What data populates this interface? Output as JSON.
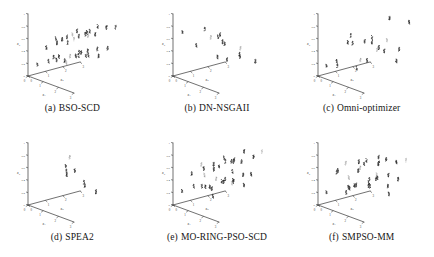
{
  "figure": {
    "title": "",
    "background": "#ffffff",
    "ink_color": "#222222",
    "panel_order": [
      "a",
      "b",
      "c",
      "d",
      "e",
      "f"
    ]
  },
  "chart_data": [
    {
      "type": "scatter",
      "id": "a",
      "panel_label": "(a)",
      "title": "BSO-SCD",
      "projection": "3d",
      "xlabel": "x1",
      "ylabel": "x2",
      "zlabel": "x3",
      "xlim": [
        0,
        3
      ],
      "ylim": [
        0,
        3
      ],
      "zlim": [
        0,
        1
      ],
      "xticks": [
        0,
        1,
        2,
        3
      ],
      "yticks": [
        0,
        1,
        2,
        3
      ],
      "zticks": [
        0,
        0.2,
        0.4,
        0.6,
        0.8,
        1
      ],
      "grid": false,
      "legend": "none",
      "marker": "dot",
      "marker_color": "#262626",
      "n_clusters": 36,
      "description": "Dense, evenly spread 6x6 lattice of tight solution clusters filling the decision space",
      "points": [
        [
          0.28,
          0.3,
          0.18
        ],
        [
          0.3,
          0.92,
          0.2
        ],
        [
          0.26,
          1.55,
          0.22
        ],
        [
          0.31,
          2.15,
          0.19
        ],
        [
          0.27,
          2.7,
          0.21
        ],
        [
          0.29,
          1.22,
          0.24
        ],
        [
          0.88,
          0.28,
          0.52
        ],
        [
          0.9,
          0.88,
          0.55
        ],
        [
          0.86,
          1.52,
          0.5
        ],
        [
          0.92,
          2.12,
          0.57
        ],
        [
          0.89,
          2.68,
          0.53
        ],
        [
          0.87,
          1.2,
          0.58
        ],
        [
          1.48,
          0.3,
          0.72
        ],
        [
          1.52,
          0.9,
          0.7
        ],
        [
          1.5,
          1.5,
          0.75
        ],
        [
          1.46,
          2.1,
          0.68
        ],
        [
          1.54,
          2.66,
          0.74
        ],
        [
          1.49,
          1.24,
          0.71
        ],
        [
          2.08,
          0.28,
          0.42
        ],
        [
          2.12,
          0.88,
          0.45
        ],
        [
          2.06,
          1.52,
          0.4
        ],
        [
          2.1,
          2.14,
          0.47
        ],
        [
          2.14,
          2.7,
          0.44
        ],
        [
          2.09,
          1.22,
          0.48
        ],
        [
          2.66,
          0.3,
          0.82
        ],
        [
          2.7,
          0.92,
          0.85
        ],
        [
          2.64,
          1.54,
          0.8
        ],
        [
          2.72,
          2.12,
          0.87
        ],
        [
          2.68,
          2.68,
          0.83
        ],
        [
          2.67,
          1.2,
          0.88
        ],
        [
          1.18,
          0.6,
          0.32
        ],
        [
          1.8,
          0.62,
          0.34
        ],
        [
          1.2,
          1.85,
          0.3
        ],
        [
          1.82,
          1.88,
          0.36
        ],
        [
          1.16,
          2.42,
          0.33
        ],
        [
          1.84,
          2.44,
          0.31
        ]
      ]
    },
    {
      "type": "scatter",
      "id": "b",
      "panel_label": "(b)",
      "title": "DN-NSGAII",
      "projection": "3d",
      "xlabel": "x1",
      "ylabel": "x2",
      "zlabel": "x3",
      "xlim": [
        0,
        3
      ],
      "ylim": [
        0,
        3
      ],
      "zlim": [
        0,
        1
      ],
      "xticks": [
        0,
        1,
        2,
        3
      ],
      "yticks": [
        0,
        1,
        2,
        3
      ],
      "zticks": [
        0,
        0.2,
        0.4,
        0.6,
        0.8,
        1
      ],
      "grid": false,
      "legend": "none",
      "marker": "dot",
      "marker_color": "#262626",
      "n_clusters": 14,
      "description": "Sparse scatter, only a handful of isolated elongated clusters, poor coverage",
      "points": [
        [
          0.26,
          0.32,
          0.7
        ],
        [
          0.28,
          1.1,
          0.44
        ],
        [
          0.3,
          2.3,
          0.16
        ],
        [
          0.88,
          1.4,
          0.6
        ],
        [
          1.5,
          0.5,
          0.86
        ],
        [
          1.56,
          1.6,
          0.54
        ],
        [
          1.48,
          2.55,
          0.26
        ],
        [
          2.05,
          1.05,
          0.66
        ],
        [
          2.12,
          1.95,
          0.4
        ],
        [
          2.62,
          0.4,
          0.88
        ],
        [
          2.7,
          1.5,
          0.58
        ],
        [
          2.66,
          2.4,
          0.3
        ],
        [
          1.9,
          0.92,
          0.74
        ],
        [
          1.2,
          2.05,
          0.22
        ]
      ]
    },
    {
      "type": "scatter",
      "id": "c",
      "panel_label": "(c)",
      "title": "Omni-optimizer",
      "projection": "3d",
      "xlabel": "x1",
      "ylabel": "x2",
      "zlabel": "x3",
      "xlim": [
        0,
        3
      ],
      "ylim": [
        0,
        3
      ],
      "zlim": [
        0,
        1
      ],
      "xticks": [
        0,
        1,
        2,
        3
      ],
      "yticks": [
        0,
        1,
        2,
        3
      ],
      "zticks": [
        0,
        0.2,
        0.4,
        0.6,
        0.8,
        1
      ],
      "grid": false,
      "legend": "none",
      "marker": "dot",
      "marker_color": "#262626",
      "n_clusters": 20,
      "description": "Moderate density, irregular spread with several clusters clumped near the lower-left floor",
      "points": [
        [
          0.24,
          0.28,
          0.16
        ],
        [
          0.26,
          0.85,
          0.2
        ],
        [
          0.3,
          1.45,
          0.46
        ],
        [
          0.28,
          2.2,
          0.12
        ],
        [
          0.86,
          0.35,
          0.22
        ],
        [
          0.9,
          1.2,
          0.52
        ],
        [
          0.88,
          2.05,
          0.18
        ],
        [
          0.92,
          2.7,
          0.34
        ],
        [
          1.45,
          0.6,
          0.74
        ],
        [
          1.52,
          1.35,
          0.6
        ],
        [
          1.48,
          2.1,
          0.4
        ],
        [
          1.5,
          2.8,
          0.86
        ],
        [
          2.02,
          0.45,
          0.28
        ],
        [
          2.1,
          1.25,
          0.64
        ],
        [
          2.06,
          2.0,
          0.44
        ],
        [
          2.12,
          2.65,
          0.24
        ],
        [
          2.62,
          0.8,
          0.8
        ],
        [
          2.68,
          1.6,
          0.7
        ],
        [
          2.64,
          2.35,
          0.5
        ],
        [
          2.72,
          2.85,
          0.9
        ]
      ]
    },
    {
      "type": "scatter",
      "id": "d",
      "panel_label": "(d)",
      "title": "SPEA2",
      "projection": "3d",
      "xlabel": "x1",
      "ylabel": "x2",
      "zlabel": "x3",
      "xlim": [
        0,
        3
      ],
      "ylim": [
        0,
        3
      ],
      "zlim": [
        0,
        1
      ],
      "xticks": [
        0,
        1,
        2,
        3
      ],
      "yticks": [
        0,
        1,
        2,
        3
      ],
      "zticks": [
        0,
        0.2,
        0.4,
        0.6,
        0.8,
        1
      ],
      "grid": false,
      "legend": "none",
      "marker": "dot",
      "marker_color": "#262626",
      "n_clusters": 8,
      "description": "Extremely sparse: one dense elongated cluster plus a few isolated faint points",
      "points": [
        [
          1.02,
          1.28,
          0.62
        ],
        [
          1.04,
          1.3,
          0.55
        ],
        [
          1.03,
          1.32,
          0.48
        ],
        [
          1.7,
          0.9,
          0.86
        ],
        [
          1.72,
          1.7,
          0.4
        ],
        [
          1.74,
          1.74,
          0.34
        ],
        [
          1.3,
          1.55,
          0.56
        ],
        [
          1.78,
          2.35,
          0.2
        ]
      ]
    },
    {
      "type": "scatter",
      "id": "e",
      "panel_label": "(e)",
      "title": "MO-RING-PSO-SCD",
      "projection": "3d",
      "xlabel": "x1",
      "ylabel": "x2",
      "zlabel": "x3",
      "xlim": [
        0,
        3
      ],
      "ylim": [
        0,
        3
      ],
      "zlim": [
        0,
        1
      ],
      "xticks": [
        0,
        1,
        2,
        3
      ],
      "yticks": [
        0,
        1,
        2,
        3
      ],
      "zticks": [
        0,
        0.2,
        0.4,
        0.6,
        0.8,
        1
      ],
      "grid": false,
      "legend": "none",
      "marker": "dot",
      "marker_color": "#262626",
      "n_clusters": 34,
      "description": "Dense, well distributed lattice of clusters covering the whole decision space",
      "points": [
        [
          0.26,
          0.3,
          0.22
        ],
        [
          0.28,
          0.95,
          0.26
        ],
        [
          0.3,
          1.6,
          0.2
        ],
        [
          0.27,
          2.25,
          0.28
        ],
        [
          0.29,
          2.75,
          0.24
        ],
        [
          0.86,
          0.32,
          0.56
        ],
        [
          0.9,
          0.98,
          0.6
        ],
        [
          0.88,
          1.58,
          0.54
        ],
        [
          0.92,
          2.2,
          0.62
        ],
        [
          0.87,
          2.72,
          0.58
        ],
        [
          1.46,
          0.34,
          0.76
        ],
        [
          1.52,
          1.0,
          0.72
        ],
        [
          1.5,
          1.62,
          0.78
        ],
        [
          1.48,
          2.22,
          0.7
        ],
        [
          1.54,
          2.74,
          0.8
        ],
        [
          2.06,
          0.3,
          0.46
        ],
        [
          2.1,
          0.96,
          0.5
        ],
        [
          2.08,
          1.56,
          0.42
        ],
        [
          2.12,
          2.18,
          0.52
        ],
        [
          2.04,
          2.7,
          0.48
        ],
        [
          2.64,
          0.32,
          0.84
        ],
        [
          2.7,
          0.98,
          0.88
        ],
        [
          2.66,
          1.6,
          0.82
        ],
        [
          2.72,
          2.24,
          0.86
        ],
        [
          2.68,
          2.76,
          0.9
        ],
        [
          1.16,
          0.64,
          0.36
        ],
        [
          1.78,
          0.66,
          0.38
        ],
        [
          1.18,
          1.88,
          0.34
        ],
        [
          1.8,
          1.9,
          0.4
        ],
        [
          1.14,
          2.46,
          0.32
        ],
        [
          1.82,
          2.48,
          0.3
        ],
        [
          0.58,
          1.3,
          0.44
        ],
        [
          2.36,
          1.34,
          0.66
        ],
        [
          1.34,
          1.12,
          0.18
        ]
      ]
    },
    {
      "type": "scatter",
      "id": "f",
      "panel_label": "(f)",
      "title": "SMPSO-MM",
      "projection": "3d",
      "xlabel": "x1",
      "ylabel": "x2",
      "zlabel": "x3",
      "xlim": [
        0,
        3
      ],
      "ylim": [
        0,
        3
      ],
      "zlim": [
        0,
        1
      ],
      "xticks": [
        0,
        1,
        2,
        3
      ],
      "yticks": [
        0,
        1,
        2,
        3
      ],
      "zticks": [
        0,
        0.2,
        0.4,
        0.6,
        0.8,
        1
      ],
      "grid": false,
      "legend": "none",
      "marker": "dot",
      "marker_color": "#262626",
      "n_clusters": 32,
      "description": "Dense but less regular than (a) and (e); mixture of dark and faint clusters across the space",
      "points": [
        [
          0.24,
          0.28,
          0.2
        ],
        [
          0.28,
          0.9,
          0.52
        ],
        [
          0.3,
          1.55,
          0.18
        ],
        [
          0.26,
          2.2,
          0.46
        ],
        [
          0.29,
          2.7,
          0.24
        ],
        [
          0.84,
          0.34,
          0.58
        ],
        [
          0.9,
          0.96,
          0.3
        ],
        [
          0.88,
          1.58,
          0.66
        ],
        [
          0.92,
          2.18,
          0.22
        ],
        [
          0.86,
          2.72,
          0.54
        ],
        [
          1.44,
          0.32,
          0.78
        ],
        [
          1.52,
          0.98,
          0.62
        ],
        [
          1.5,
          1.6,
          0.38
        ],
        [
          1.46,
          2.2,
          0.74
        ],
        [
          1.54,
          2.7,
          0.42
        ],
        [
          2.04,
          0.3,
          0.48
        ],
        [
          2.1,
          0.94,
          0.84
        ],
        [
          2.06,
          1.56,
          0.56
        ],
        [
          2.12,
          2.16,
          0.34
        ],
        [
          2.08,
          2.68,
          0.68
        ],
        [
          2.62,
          0.34,
          0.88
        ],
        [
          2.7,
          0.96,
          0.6
        ],
        [
          2.66,
          1.58,
          0.86
        ],
        [
          2.72,
          2.22,
          0.5
        ],
        [
          2.64,
          2.74,
          0.76
        ],
        [
          1.14,
          0.62,
          0.26
        ],
        [
          1.76,
          0.64,
          0.44
        ],
        [
          1.2,
          1.86,
          0.28
        ],
        [
          1.82,
          1.9,
          0.7
        ],
        [
          1.12,
          2.44,
          0.36
        ],
        [
          1.84,
          2.46,
          0.16
        ],
        [
          0.56,
          1.28,
          0.4
        ]
      ]
    }
  ]
}
